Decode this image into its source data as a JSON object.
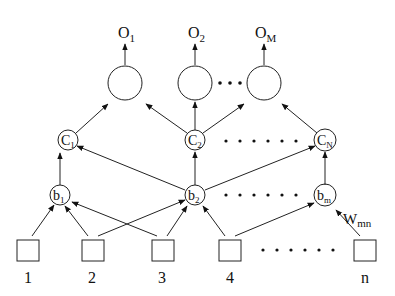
{
  "diagram": {
    "outputs": [
      {
        "id": "O1",
        "label": "O",
        "sub": "1",
        "x": 125
      },
      {
        "id": "O2",
        "label": "O",
        "sub": "2",
        "x": 195
      },
      {
        "id": "OM",
        "label": "O",
        "sub": "M",
        "x": 264
      }
    ],
    "c_nodes": [
      {
        "id": "C1",
        "label": "C",
        "sub": "1",
        "x": 68
      },
      {
        "id": "C2",
        "label": "C",
        "sub": "2",
        "x": 195
      },
      {
        "id": "CN",
        "label": "C",
        "sub": "N",
        "x": 325
      }
    ],
    "b_nodes": [
      {
        "id": "b1",
        "label": "b",
        "sub": "1",
        "x": 60
      },
      {
        "id": "b2",
        "label": "b",
        "sub": "2",
        "x": 195
      },
      {
        "id": "bm",
        "label": "b",
        "sub": "m",
        "x": 325
      }
    ],
    "inputs": [
      {
        "id": "in1",
        "label": "1",
        "x": 28
      },
      {
        "id": "in2",
        "label": "2",
        "x": 92
      },
      {
        "id": "in3",
        "label": "3",
        "x": 162
      },
      {
        "id": "in4",
        "label": "4",
        "x": 230
      },
      {
        "id": "inn",
        "label": "n",
        "x": 365
      }
    ],
    "weight_label": {
      "label": "W",
      "sub": "mn"
    },
    "ellipsis": "• • • • • •"
  }
}
